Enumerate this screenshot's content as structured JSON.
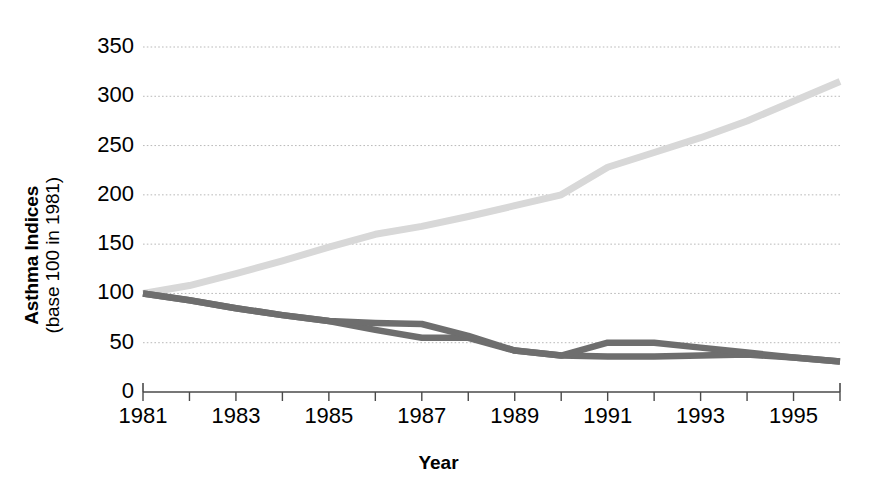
{
  "chart_data": {
    "type": "line",
    "title": "",
    "xlabel": "Year",
    "ylabel_line1": "Asthma Indices",
    "ylabel_line2": "(base 100 in 1981)",
    "xlim": [
      1981,
      1996
    ],
    "ylim": [
      0,
      350
    ],
    "grid": true,
    "legend": "none",
    "y_ticks": [
      350,
      300,
      250,
      200,
      150,
      100,
      50,
      0
    ],
    "x_ticks": [
      1981,
      1982,
      1983,
      1984,
      1985,
      1986,
      1987,
      1988,
      1989,
      1990,
      1991,
      1992,
      1993,
      1994,
      1995,
      1996
    ],
    "x_tick_labels": [
      "1981",
      "",
      "1983",
      "",
      "1985",
      "",
      "1987",
      "",
      "1989",
      "",
      "1991",
      "",
      "1993",
      "",
      "1995",
      ""
    ],
    "series": [
      {
        "name": "asthma-prevalence-rising",
        "color": "#d8d8d8",
        "x": [
          1981,
          1982,
          1983,
          1984,
          1985,
          1986,
          1987,
          1988,
          1989,
          1990,
          1991,
          1992,
          1993,
          1994,
          1995,
          1996
        ],
        "values": [
          100,
          108,
          120,
          133,
          147,
          160,
          168,
          178,
          189,
          200,
          228,
          243,
          258,
          275,
          295,
          315
        ]
      },
      {
        "name": "asthma-decline-upper",
        "color": "#6e6e6e",
        "x": [
          1981,
          1982,
          1983,
          1984,
          1985,
          1986,
          1987,
          1988,
          1989,
          1990,
          1991,
          1992,
          1993,
          1994,
          1995,
          1996
        ],
        "values": [
          100,
          93,
          85,
          78,
          72,
          70,
          69,
          57,
          42,
          37,
          50,
          50,
          45,
          40,
          35,
          31
        ]
      },
      {
        "name": "asthma-decline-lower",
        "color": "#6e6e6e",
        "x": [
          1981,
          1982,
          1983,
          1984,
          1985,
          1986,
          1987,
          1988,
          1989,
          1990,
          1991,
          1992,
          1993,
          1994,
          1995,
          1996
        ],
        "values": [
          100,
          93,
          85,
          78,
          72,
          63,
          55,
          55,
          42,
          37,
          36,
          36,
          37,
          38,
          35,
          31
        ]
      }
    ]
  },
  "axis": {
    "y_labels": [
      "350",
      "300",
      "250",
      "200",
      "150",
      "100",
      "50",
      "0"
    ],
    "x_labels": [
      "1981",
      "1983",
      "1985",
      "1987",
      "1989",
      "1991",
      "1993",
      "1995"
    ],
    "x_label_years": [
      1981,
      1983,
      1985,
      1987,
      1989,
      1991,
      1993,
      1995
    ],
    "x_axis_title": "Year",
    "y_axis_title_bold": "Asthma Indices",
    "y_axis_title_regular": "(base 100 in 1981)"
  },
  "colors": {
    "light_series": "#d8d8d8",
    "dark_series": "#6e6e6e",
    "grid": "#b9b9b9",
    "axis": "#4a4a4a",
    "text": "#000000",
    "background": "#ffffff"
  }
}
